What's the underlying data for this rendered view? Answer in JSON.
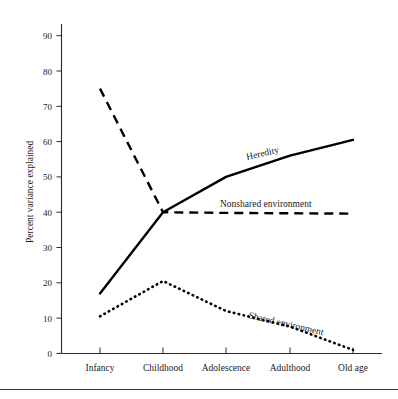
{
  "chart_data": {
    "type": "line",
    "title": "",
    "xlabel": "",
    "ylabel": "Percent variance explained",
    "categories": [
      "Infancy",
      "Childhood",
      "Adolescence",
      "Adulthood",
      "Old age"
    ],
    "ylim": [
      0,
      95
    ],
    "yticks": [
      0,
      10,
      20,
      30,
      40,
      50,
      60,
      70,
      80,
      90
    ],
    "ytick_labels": [
      "0",
      "10",
      "20",
      "30",
      "40",
      "50",
      "60",
      "70",
      "80",
      "90"
    ],
    "grid": false,
    "legend_position": "inline-annotations",
    "series": [
      {
        "name": "Heredity",
        "style": "solid",
        "color": "#000000",
        "values": [
          17,
          40,
          50,
          56,
          60.5
        ],
        "label": "Heredity",
        "label_rotation": -13
      },
      {
        "name": "Nonshared environment",
        "style": "dashed",
        "color": "#000000",
        "values": [
          75,
          40,
          39.8,
          39.7,
          39.6
        ],
        "label": "Nonshared environment",
        "label_rotation": 0
      },
      {
        "name": "Shared environment",
        "style": "dotted",
        "color": "#000000",
        "values": [
          10.5,
          20.5,
          12,
          7.6,
          1
        ],
        "label": "Shared environment",
        "label_rotation": 13
      }
    ],
    "annotations": [
      {
        "text": "Heredity",
        "x_category": "Adolescence",
        "value": 55
      },
      {
        "text": "Nonshared environment",
        "x_category": "Adolescence",
        "value": 43
      },
      {
        "text": "Shared environment",
        "x_category": "Adulthood",
        "value": 11
      }
    ]
  },
  "figure": {
    "has_footer_rule": true,
    "background": "#ffffff",
    "ink": "#000000"
  }
}
